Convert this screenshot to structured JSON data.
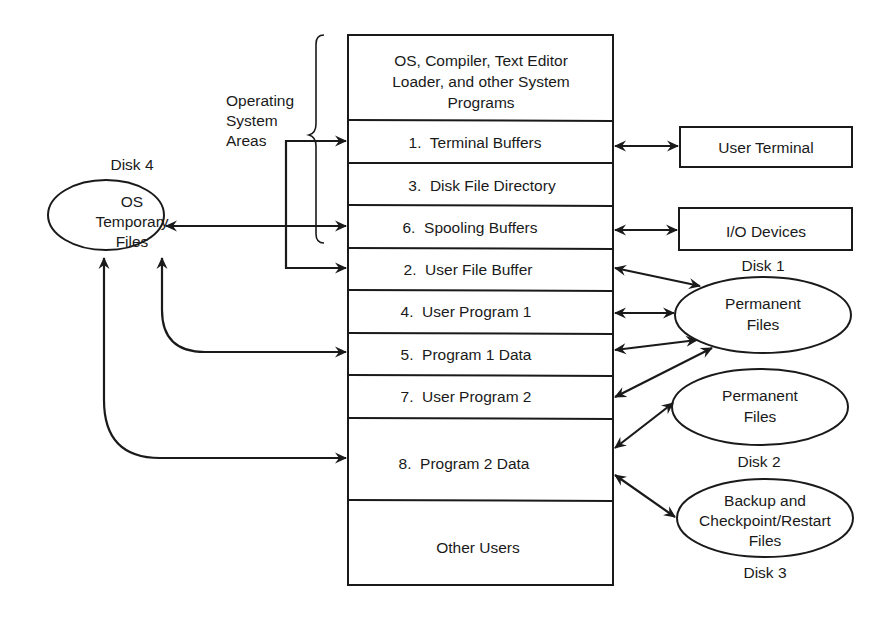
{
  "memory_stack": {
    "rows": [
      {
        "lines": [
          "OS, Compiler, Text Editor",
          "Loader, and other System",
          "Programs"
        ]
      },
      {
        "lines": [
          "1.  Terminal Buffers"
        ]
      },
      {
        "lines": [
          "3.  Disk File Directory"
        ]
      },
      {
        "lines": [
          "6.  Spooling Buffers"
        ]
      },
      {
        "lines": [
          "2.  User File Buffer"
        ]
      },
      {
        "lines": [
          "4.  User Program 1"
        ]
      },
      {
        "lines": [
          "5.  Program 1 Data"
        ]
      },
      {
        "lines": [
          "7.  User Program 2"
        ]
      },
      {
        "lines": [
          "8.  Program 2 Data"
        ]
      },
      {
        "lines": [
          "Other Users"
        ]
      }
    ]
  },
  "brace_label": {
    "lines": [
      "Operating",
      "System",
      "Areas"
    ]
  },
  "disk4": {
    "caption": "Disk 4",
    "lines": [
      "OS",
      "Temporary",
      "Files"
    ]
  },
  "devices": {
    "user_terminal": "User Terminal",
    "io_devices": "I/O Devices"
  },
  "disk1": {
    "caption": "Disk 1",
    "lines": [
      "Permanent",
      "Files"
    ]
  },
  "disk2": {
    "caption": "Disk 2",
    "lines": [
      "Permanent",
      "Files"
    ]
  },
  "disk3": {
    "caption": "Disk 3",
    "lines": [
      "Backup and",
      "Checkpoint/Restart",
      "Files"
    ]
  },
  "colors": {
    "ink": "#1a1a1a",
    "background": "#ffffff"
  }
}
